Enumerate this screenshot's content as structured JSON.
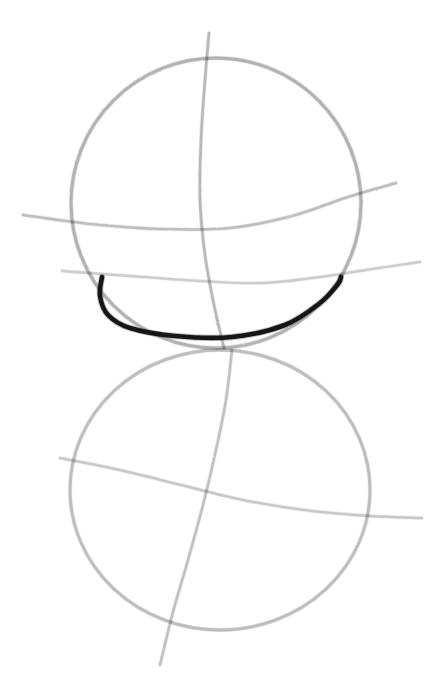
{
  "artwork": {
    "title": "Two-sphere construction sketch",
    "medium": "graphite pencil on white paper",
    "background_color": "#ffffff",
    "canvas": {
      "width": 444,
      "height": 690
    }
  },
  "palette": {
    "paper": "#ffffff",
    "pencil_light": "#c9c9c9",
    "pencil_mid": "#a9a9a9",
    "pencil_dark": "#8f8f8f",
    "accent_dark": "#111111"
  },
  "chart_data": {
    "type": "line",
    "xlabel": "",
    "ylabel": "",
    "xlim": [
      0,
      444
    ],
    "ylim": [
      0,
      690
    ],
    "grid": false,
    "legend": "none",
    "series": [
      {
        "name": "upper-sphere-outline",
        "role": "circle",
        "color": "#a9a9a9",
        "width": 3.0,
        "closed": true,
        "cx": 216,
        "cy": 203,
        "rx": 145,
        "ry": 145,
        "bbox": [
          71,
          58,
          362,
          348
        ]
      },
      {
        "name": "lower-sphere-outline",
        "role": "circle",
        "color": "#b4b4b4",
        "width": 2.8,
        "closed": true,
        "cx": 220,
        "cy": 490,
        "rx": 150,
        "ry": 140,
        "bbox": [
          70,
          350,
          370,
          630
        ]
      },
      {
        "name": "upper-vertical-meridian",
        "role": "curve",
        "color": "#b0b0b0",
        "width": 2.6,
        "points": [
          [
            209,
            33
          ],
          [
            205,
            80
          ],
          [
            201,
            140
          ],
          [
            200,
            200
          ],
          [
            205,
            255
          ],
          [
            214,
            305
          ],
          [
            224,
            348
          ]
        ]
      },
      {
        "name": "lower-vertical-meridian",
        "role": "curve",
        "color": "#b8b8b8",
        "width": 2.6,
        "points": [
          [
            232,
            350
          ],
          [
            226,
            400
          ],
          [
            216,
            450
          ],
          [
            203,
            505
          ],
          [
            188,
            560
          ],
          [
            173,
            612
          ],
          [
            160,
            665
          ]
        ]
      },
      {
        "name": "upper-equator-curve",
        "role": "curve",
        "color": "#b6b6b6",
        "width": 2.6,
        "points": [
          [
            23,
            215
          ],
          [
            90,
            224
          ],
          [
            160,
            229
          ],
          [
            230,
            228
          ],
          [
            292,
            216
          ],
          [
            345,
            198
          ],
          [
            396,
            183
          ]
        ]
      },
      {
        "name": "upper-lower-latitude-curve",
        "role": "curve",
        "color": "#c6c6c6",
        "width": 2.4,
        "points": [
          [
            62,
            271
          ],
          [
            130,
            276
          ],
          [
            200,
            281
          ],
          [
            262,
            283
          ],
          [
            320,
            277
          ],
          [
            372,
            269
          ],
          [
            420,
            262
          ]
        ]
      },
      {
        "name": "lower-equator-curve",
        "role": "curve",
        "color": "#c0c0c0",
        "width": 2.5,
        "points": [
          [
            60,
            458
          ],
          [
            120,
            470
          ],
          [
            185,
            486
          ],
          [
            248,
            501
          ],
          [
            312,
            511
          ],
          [
            370,
            516
          ],
          [
            422,
            518
          ]
        ]
      },
      {
        "name": "dark-jaw-arc",
        "role": "accent-curve",
        "color": "#111111",
        "width": 4.6,
        "points": [
          [
            102,
            277
          ],
          [
            100,
            296
          ],
          [
            108,
            315
          ],
          [
            130,
            328
          ],
          [
            175,
            336
          ],
          [
            232,
            337
          ],
          [
            285,
            325
          ],
          [
            320,
            303
          ],
          [
            338,
            284
          ],
          [
            341,
            277
          ]
        ]
      }
    ],
    "annotations": []
  },
  "layers": [
    {
      "id": "upper-sphere",
      "label": "Upper sphere construction",
      "visible": true
    },
    {
      "id": "lower-sphere",
      "label": "Lower sphere construction",
      "visible": true
    },
    {
      "id": "meridians",
      "label": "Vertical meridian guides",
      "visible": true
    },
    {
      "id": "latitudes",
      "label": "Horizontal latitude guides",
      "visible": true
    },
    {
      "id": "accent",
      "label": "Dark emphasized jaw arc",
      "visible": true
    }
  ]
}
